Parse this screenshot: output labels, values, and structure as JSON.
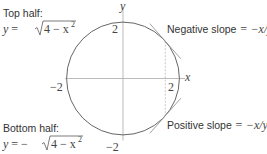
{
  "diagram": {
    "axes": {
      "x_label": "x",
      "y_label": "y",
      "x_range": [
        -2,
        2
      ],
      "y_range": [
        -2,
        2
      ]
    },
    "circle": {
      "radius": 2,
      "center": [
        0,
        0
      ],
      "equation": "x^2 + y^2 = 4"
    },
    "tick_labels": {
      "y_top": "2",
      "y_bottom": "−2",
      "x_left": "−2",
      "x_right": "2"
    },
    "tangent_x": 1.5,
    "annotations": {
      "top_half_title": "Top half:",
      "top_half_eq_lhs": "y",
      "top_half_eq_eq": " = ",
      "top_half_eq_rad": "4 − x",
      "top_half_eq_exp": "2",
      "bottom_half_title": "Bottom half:",
      "bottom_half_eq_lhs": "y",
      "bottom_half_eq_eq": " = −",
      "bottom_half_eq_rad": "4 − x",
      "bottom_half_eq_exp": "2",
      "negative_slope_text": "Negative slope ",
      "negative_slope_eq": "= −x/y",
      "positive_slope_text": "Positive slope ",
      "positive_slope_eq": "= −x/y"
    },
    "colors": {
      "circle": "#555555",
      "axes": "#aaaaaa",
      "tangent": "#999999",
      "dashed": "#bbbbbb"
    }
  }
}
